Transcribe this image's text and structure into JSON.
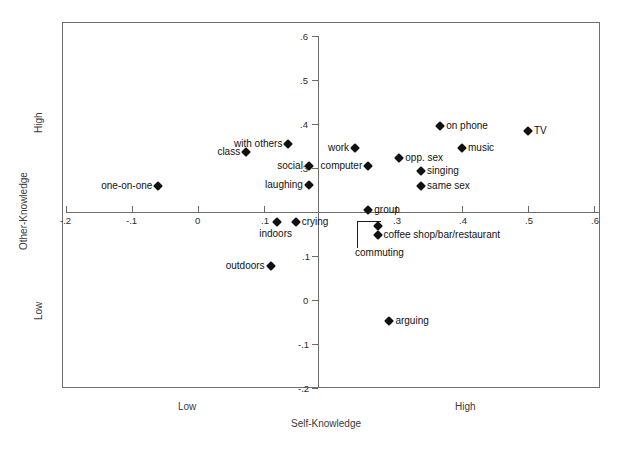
{
  "figure": {
    "background": "#ffffff",
    "frame_color": "#6e6e6e",
    "marker_color": "#111111"
  },
  "axis_titles": {
    "x_title": "Self-Knowledge",
    "y_title": "Other-Knowledge",
    "x_low": "Low",
    "x_high": "High",
    "y_low": "Low",
    "y_high": "High"
  },
  "chart_data": {
    "type": "scatter",
    "title": "",
    "xlabel": "Self-Knowledge",
    "ylabel": "Other-Knowledge",
    "xlim": [
      -0.2,
      0.6
    ],
    "ylim": [
      -0.2,
      0.6
    ],
    "xticks": [
      "-.2",
      "-.1",
      "0",
      ".1",
      ".2",
      ".3",
      ".4",
      ".5",
      ".6"
    ],
    "xtick_values": [
      -0.2,
      -0.1,
      0,
      0.1,
      0.2,
      0.3,
      0.4,
      0.5,
      0.6
    ],
    "yticks": [
      ".6",
      ".5",
      ".4",
      ".3",
      ".2",
      ".1",
      "0",
      "-.1",
      "-.2"
    ],
    "ytick_values": [
      0.6,
      0.5,
      0.4,
      0.3,
      0.2,
      0.1,
      0,
      -0.1,
      -0.2
    ],
    "grid": false,
    "legend": "none",
    "axes_cross_at": [
      0.18,
      0.2
    ],
    "points": [
      {
        "label": "TV",
        "x": 0.5,
        "y": 0.385,
        "label_side": "right"
      },
      {
        "label": "on phone",
        "x": 0.367,
        "y": 0.395,
        "label_side": "right"
      },
      {
        "label": "music",
        "x": 0.4,
        "y": 0.345,
        "label_side": "right"
      },
      {
        "label": "with others",
        "x": 0.137,
        "y": 0.355,
        "label_side": "left"
      },
      {
        "label": "work",
        "x": 0.238,
        "y": 0.345,
        "label_side": "left"
      },
      {
        "label": "class",
        "x": 0.073,
        "y": 0.337,
        "label_side": "left"
      },
      {
        "label": "opp. sex",
        "x": 0.305,
        "y": 0.323,
        "label_side": "right"
      },
      {
        "label": "social",
        "x": 0.168,
        "y": 0.305,
        "label_side": "left"
      },
      {
        "label": "computer",
        "x": 0.258,
        "y": 0.305,
        "label_side": "left"
      },
      {
        "label": "singing",
        "x": 0.338,
        "y": 0.293,
        "label_side": "right"
      },
      {
        "label": "same sex",
        "x": 0.338,
        "y": 0.258,
        "label_side": "right"
      },
      {
        "label": "laughing",
        "x": 0.168,
        "y": 0.262,
        "label_side": "left"
      },
      {
        "label": "one-on-one",
        "x": -0.06,
        "y": 0.258,
        "label_side": "left"
      },
      {
        "label": "group",
        "x": 0.258,
        "y": 0.205,
        "label_side": "right"
      },
      {
        "label": "crying",
        "x": 0.148,
        "y": 0.178,
        "label_side": "right"
      },
      {
        "label": "indoors",
        "x": 0.12,
        "y": 0.178,
        "label_side": "below"
      },
      {
        "label": "commuting",
        "x": 0.272,
        "y": 0.168,
        "label_side": "callout"
      },
      {
        "label": "coffee shop/bar/restaurant",
        "x": 0.272,
        "y": 0.148,
        "label_side": "right"
      },
      {
        "label": "outdoors",
        "x": 0.11,
        "y": 0.078,
        "label_side": "left"
      },
      {
        "label": "arguing",
        "x": 0.29,
        "y": -0.048,
        "label_side": "right"
      }
    ]
  }
}
